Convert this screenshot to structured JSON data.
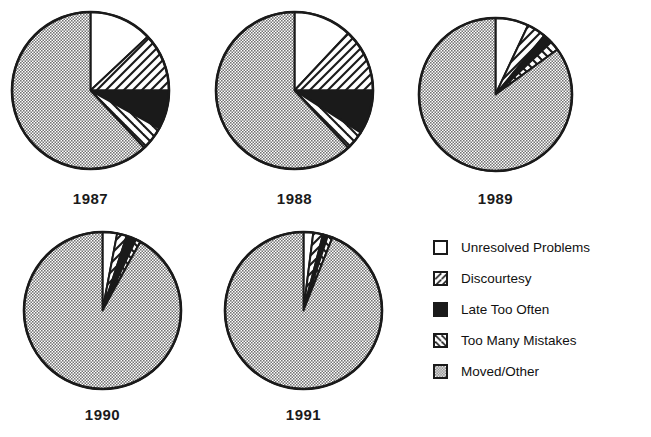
{
  "chart_data": {
    "type": "pie",
    "title": "",
    "subtitle": "",
    "xlabel": "",
    "ylabel": "",
    "grid": false,
    "legend_position": "right-bottom",
    "units": "percent",
    "categories": [
      "Unresolved Problems",
      "Discourtesy",
      "Late Too Often",
      "Too Many Mistakes",
      "Moved/Other"
    ],
    "category_fills": [
      "white",
      "forward-hatch",
      "solid-black",
      "back-hatch",
      "gray-stipple"
    ],
    "colors": {
      "white": "#ffffff",
      "black": "#1a1a1a",
      "gray_stipple": "#b4b4b4",
      "outline": "#1a1a1a",
      "text": "#111111",
      "background": "#ffffff"
    },
    "panels": [
      {
        "label": "1987",
        "values": [
          13,
          12,
          8,
          5,
          62
        ]
      },
      {
        "label": "1988",
        "values": [
          12,
          13,
          9,
          4,
          62
        ]
      },
      {
        "label": "1989",
        "values": [
          7,
          4,
          2,
          2,
          85
        ]
      },
      {
        "label": "1990",
        "values": [
          3,
          2,
          2,
          1,
          92
        ]
      },
      {
        "label": "1991",
        "values": [
          2,
          2,
          1,
          1,
          94
        ]
      }
    ]
  },
  "legend": {
    "items": [
      {
        "label": "Unresolved Problems",
        "fill": "white"
      },
      {
        "label": "Discourtesy",
        "fill": "forward-hatch"
      },
      {
        "label": "Late Too Often",
        "fill": "solid-black"
      },
      {
        "label": "Too Many Mistakes",
        "fill": "back-hatch"
      },
      {
        "label": "Moved/Other",
        "fill": "gray-stipple"
      }
    ]
  },
  "panel_labels": {
    "p0": "1987",
    "p1": "1988",
    "p2": "1989",
    "p3": "1990",
    "p4": "1991"
  }
}
